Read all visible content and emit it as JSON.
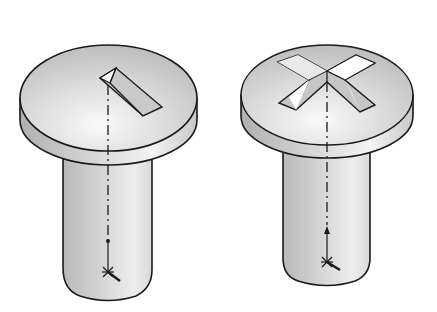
{
  "figure": {
    "colors": {
      "background": "#ffffff",
      "outline": "#1a1a1a",
      "surface_light": "#f2f2f2",
      "surface_mid": "#d0d0d0",
      "surface_dark": "#a8a8a8"
    },
    "items": [
      {
        "id": "slotted-screw",
        "head_type": "slotted",
        "has_centerline": true,
        "has_origin_marker": true
      },
      {
        "id": "phillips-screw",
        "head_type": "cross-recess",
        "has_centerline": true,
        "has_origin_marker": true
      }
    ]
  }
}
